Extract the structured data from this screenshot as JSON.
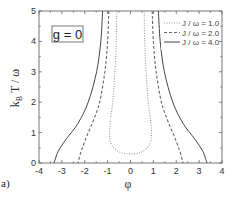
{
  "chart_data": {
    "type": "line",
    "title": "",
    "annotation": "g = 0",
    "panel_label": "a)",
    "xlabel": "φ",
    "ylabel": "k_B T / ω",
    "xlim": [
      -4,
      4
    ],
    "ylim": [
      0,
      5
    ],
    "xticks": [
      -4,
      -3,
      -2,
      -1,
      0,
      1,
      2,
      3,
      4
    ],
    "yticks": [
      0,
      1,
      2,
      3,
      4,
      5
    ],
    "grid": false,
    "legend_position": "upper right",
    "series": [
      {
        "name": "J / ω = 1.0",
        "style": "dotted",
        "color": "#999999",
        "points": [
          [
            -0.6,
            5.0
          ],
          [
            -0.62,
            4.0
          ],
          [
            -0.68,
            3.0
          ],
          [
            -0.78,
            2.0
          ],
          [
            -0.88,
            1.4
          ],
          [
            -0.92,
            1.0
          ],
          [
            -0.88,
            0.7
          ],
          [
            -0.7,
            0.48
          ],
          [
            -0.4,
            0.34
          ],
          [
            0.0,
            0.3
          ],
          [
            0.4,
            0.34
          ],
          [
            0.7,
            0.48
          ],
          [
            0.88,
            0.7
          ],
          [
            0.92,
            1.0
          ],
          [
            0.88,
            1.4
          ],
          [
            0.78,
            2.0
          ],
          [
            0.68,
            3.0
          ],
          [
            0.62,
            4.0
          ],
          [
            0.6,
            5.0
          ]
        ]
      },
      {
        "name": "J / ω = 2.0",
        "style": "dashed",
        "color": "#666666",
        "points": [
          [
            -0.95,
            5.0
          ],
          [
            -1.0,
            4.0
          ],
          [
            -1.12,
            3.0
          ],
          [
            -1.35,
            2.0
          ],
          [
            -1.62,
            1.4
          ],
          [
            -1.9,
            0.9
          ],
          [
            -2.15,
            0.4
          ],
          [
            -2.3,
            0.0
          ]
        ],
        "mirror": true,
        "points_right": [
          [
            0.95,
            5.0
          ],
          [
            1.0,
            4.0
          ],
          [
            1.12,
            3.0
          ],
          [
            1.35,
            2.0
          ],
          [
            1.62,
            1.4
          ],
          [
            1.9,
            0.9
          ],
          [
            2.15,
            0.4
          ],
          [
            2.3,
            0.0
          ]
        ]
      },
      {
        "name": "J / ω = 4.0",
        "style": "solid",
        "color": "#444444",
        "points": [
          [
            -1.22,
            5.0
          ],
          [
            -1.3,
            4.0
          ],
          [
            -1.48,
            3.0
          ],
          [
            -1.85,
            2.0
          ],
          [
            -2.3,
            1.3
          ],
          [
            -2.8,
            0.8
          ],
          [
            -3.15,
            0.4
          ],
          [
            -3.3,
            0.1
          ],
          [
            -3.35,
            0.0
          ]
        ],
        "points_right": [
          [
            1.22,
            5.0
          ],
          [
            1.3,
            4.0
          ],
          [
            1.48,
            3.0
          ],
          [
            1.85,
            2.0
          ],
          [
            2.3,
            1.3
          ],
          [
            2.8,
            0.8
          ],
          [
            3.15,
            0.4
          ],
          [
            3.3,
            0.1
          ],
          [
            3.35,
            0.0
          ]
        ]
      }
    ]
  },
  "legend": {
    "items": [
      "J / ω = 1.0",
      "J / ω = 2.0",
      "J / ω = 4.0"
    ]
  }
}
